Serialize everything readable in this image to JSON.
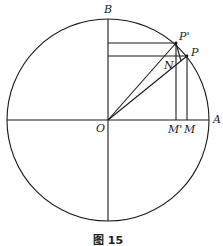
{
  "figure": {
    "caption": "图 15",
    "circle": {
      "cx": 108,
      "cy": 120,
      "r": 101
    },
    "points": {
      "O": {
        "label": "O",
        "x": 108,
        "y": 120
      },
      "A": {
        "label": "A",
        "x": 209,
        "y": 120
      },
      "B": {
        "label": "B",
        "x": 108,
        "y": 19
      },
      "P": {
        "label": "P",
        "x": 187,
        "y": 56
      },
      "P_prime": {
        "label": "P'",
        "x": 176,
        "y": 43
      },
      "N": {
        "label": "N",
        "x": 181,
        "y": 61
      },
      "M": {
        "label": "M",
        "x": 187,
        "y": 120
      },
      "M_prime": {
        "label": "M'",
        "x": 176,
        "y": 120
      }
    },
    "labels": {
      "B": "B",
      "P_prime": "P'",
      "P": "P",
      "N": "N",
      "O": "O",
      "M_prime": "M'",
      "M": "M",
      "A": "A"
    },
    "stroke_color": "#1a1a1a"
  }
}
